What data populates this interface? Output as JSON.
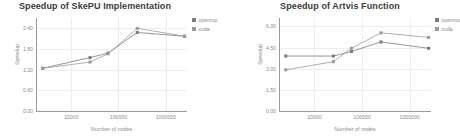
{
  "chart_data": [
    {
      "type": "line",
      "title": "Speedup of SkePU Implementation",
      "xlabel": "Number of nodes",
      "ylabel": "Speedup",
      "xscale": "log",
      "x": [
        2500,
        25000,
        60000,
        250000,
        2500000
      ],
      "xtick_labels": [
        "10000",
        "100000",
        "1000000"
      ],
      "xtick_values": [
        10000,
        100000,
        1000000
      ],
      "ytick_labels": [
        "2.40",
        "1.80",
        "1.20",
        "0.60",
        "0.00"
      ],
      "ytick_values": [
        2.4,
        1.8,
        1.2,
        0.6,
        0.0
      ],
      "ylim": [
        0.0,
        2.7
      ],
      "grid": true,
      "legend_position": "right",
      "series": [
        {
          "name": "openmp",
          "color": "#7b7b7b",
          "values": [
            1.24,
            1.55,
            1.68,
            2.28,
            2.17
          ]
        },
        {
          "name": "cuda",
          "color": "#9a9a9a",
          "values": [
            1.24,
            1.42,
            1.66,
            2.4,
            2.17
          ]
        }
      ]
    },
    {
      "type": "line",
      "title": "Speedup of Artvis Function",
      "xlabel": "Number of nodes",
      "ylabel": "Speedup",
      "xscale": "log",
      "x": [
        2500,
        25000,
        60000,
        250000,
        2500000
      ],
      "xtick_labels": [
        "10000",
        "100000",
        "1000000"
      ],
      "xtick_values": [
        10000,
        100000,
        1000000
      ],
      "ytick_labels": [
        "6.00",
        "4.50",
        "3.00",
        "1.50",
        "0.00"
      ],
      "ytick_values": [
        6.0,
        4.5,
        3.0,
        1.5,
        0.0
      ],
      "ylim": [
        0.0,
        6.6
      ],
      "grid": true,
      "legend_position": "right",
      "series": [
        {
          "name": "openmp",
          "color": "#7b7b7b",
          "values": [
            3.9,
            3.9,
            4.22,
            4.9,
            4.45
          ]
        },
        {
          "name": "cuda",
          "color": "#9a9a9a",
          "values": [
            2.92,
            3.5,
            4.45,
            5.55,
            5.22
          ]
        }
      ]
    }
  ],
  "legend": {
    "entries": [
      {
        "label": "openmp",
        "color": "#7b7b7b"
      },
      {
        "label": "cuda",
        "color": "#9a9a9a"
      }
    ]
  }
}
